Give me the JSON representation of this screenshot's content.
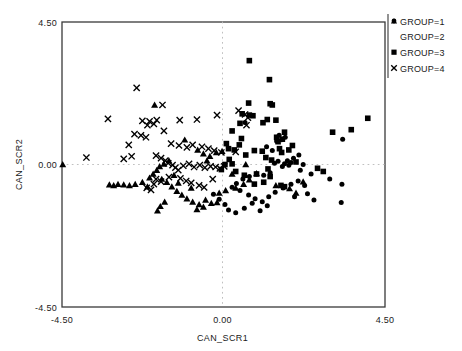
{
  "chart_data": {
    "type": "scatter",
    "title": "",
    "xlabel": "CAN_SCR1",
    "ylabel": "CAN_SCR2",
    "xlim": [
      -4.5,
      4.5
    ],
    "ylim": [
      -4.5,
      4.5
    ],
    "xticks": [
      -4.5,
      0.0,
      4.5
    ],
    "xtick_labels": [
      "-4.50",
      "0.00",
      "4.50"
    ],
    "yticks": [
      -4.5,
      0.0,
      4.5
    ],
    "ytick_labels": [
      "-4.50",
      "0.00",
      "4.50"
    ],
    "grid": false,
    "reference_lines": {
      "x": 0.0,
      "y": 0.0,
      "style": "dotted"
    },
    "legend_position": "top-right-outside",
    "legend": [
      {
        "label": "GROUP=1",
        "marker": "circle"
      },
      {
        "label": "GROUP=2",
        "marker": "triangle"
      },
      {
        "label": "GROUP=3",
        "marker": "square"
      },
      {
        "label": "GROUP=4",
        "marker": "x"
      }
    ],
    "series": [
      {
        "name": "GROUP=1",
        "marker": "circle",
        "points": [
          [
            0.6,
            1.33
          ],
          [
            1.55,
            0.92
          ],
          [
            1.72,
            0.86
          ],
          [
            1.62,
            0.78
          ],
          [
            1.48,
            0.74
          ],
          [
            3.32,
            0.8
          ],
          [
            2.1,
            0.3
          ],
          [
            1.95,
            0.2
          ],
          [
            1.78,
            0.12
          ],
          [
            1.88,
            0.06
          ],
          [
            1.7,
            0.02
          ],
          [
            1.82,
            -0.02
          ],
          [
            1.64,
            -0.06
          ],
          [
            1.52,
            0.1
          ],
          [
            1.42,
            0.04
          ],
          [
            2.22,
            0.0
          ],
          [
            1.3,
            -0.26
          ],
          [
            1.12,
            -0.34
          ],
          [
            0.92,
            -0.3
          ],
          [
            0.72,
            -0.38
          ],
          [
            0.54,
            -0.46
          ],
          [
            0.36,
            -0.6
          ],
          [
            0.24,
            -0.72
          ],
          [
            0.46,
            -0.82
          ],
          [
            0.7,
            -0.96
          ],
          [
            0.88,
            -1.08
          ],
          [
            1.08,
            -1.18
          ],
          [
            1.26,
            -1.02
          ],
          [
            1.44,
            -0.88
          ],
          [
            1.66,
            -0.74
          ],
          [
            1.88,
            -0.62
          ],
          [
            2.08,
            -0.52
          ],
          [
            2.26,
            -0.66
          ],
          [
            2.34,
            -0.92
          ],
          [
            2.52,
            -1.12
          ],
          [
            2.96,
            -0.46
          ],
          [
            3.3,
            -0.62
          ],
          [
            3.28,
            -1.2
          ],
          [
            0.14,
            -1.44
          ],
          [
            0.34,
            -1.52
          ],
          [
            0.58,
            -1.38
          ],
          [
            0.04,
            -1.26
          ],
          [
            -0.12,
            -1.1
          ],
          [
            -0.28,
            -0.94
          ],
          [
            1.02,
            -1.46
          ],
          [
            1.22,
            -1.3
          ],
          [
            0.8,
            -1.22
          ],
          [
            2.44,
            -0.3
          ],
          [
            1.98,
            -1.02
          ],
          [
            2.14,
            -0.18
          ],
          [
            1.36,
            0.44
          ],
          [
            1.2,
            0.56
          ]
        ]
      },
      {
        "name": "GROUP=2",
        "marker": "triangle",
        "points": [
          [
            -4.48,
            0.0
          ],
          [
            -1.92,
            1.88
          ],
          [
            -1.08,
            0.78
          ],
          [
            -0.72,
            0.46
          ],
          [
            -0.56,
            0.34
          ],
          [
            -0.38,
            0.26
          ],
          [
            -0.2,
            0.38
          ],
          [
            -0.04,
            0.42
          ],
          [
            -1.52,
            0.12
          ],
          [
            -1.66,
            0.02
          ],
          [
            -1.78,
            -0.06
          ],
          [
            -1.86,
            -0.18
          ],
          [
            -1.96,
            -0.3
          ],
          [
            -2.06,
            -0.42
          ],
          [
            -2.26,
            -0.56
          ],
          [
            -2.46,
            -0.62
          ],
          [
            -2.62,
            -0.66
          ],
          [
            -2.78,
            -0.64
          ],
          [
            -2.94,
            -0.62
          ],
          [
            -3.06,
            -0.66
          ],
          [
            -3.18,
            -0.64
          ],
          [
            -1.72,
            -0.46
          ],
          [
            -1.58,
            -0.56
          ],
          [
            -1.44,
            -0.7
          ],
          [
            -1.3,
            -0.84
          ],
          [
            -1.16,
            -0.96
          ],
          [
            -1.02,
            -1.08
          ],
          [
            -0.86,
            -1.18
          ],
          [
            -0.68,
            -1.26
          ],
          [
            -0.5,
            -1.12
          ],
          [
            -0.34,
            -1.22
          ],
          [
            -0.18,
            -1.2
          ],
          [
            -0.56,
            -1.34
          ],
          [
            -0.74,
            -1.42
          ],
          [
            -1.64,
            -1.18
          ],
          [
            -1.76,
            -1.32
          ],
          [
            -1.84,
            -1.46
          ],
          [
            -0.12,
            -0.9
          ],
          [
            0.06,
            -0.82
          ],
          [
            0.34,
            -0.74
          ],
          [
            0.56,
            -0.62
          ],
          [
            0.72,
            -0.48
          ],
          [
            0.24,
            -0.3
          ],
          [
            1.46,
            -0.66
          ],
          [
            1.84,
            -0.76
          ],
          [
            2.02,
            -0.9
          ],
          [
            0.92,
            -0.28
          ],
          [
            0.62,
            0.0
          ],
          [
            2.22,
            -0.54
          ],
          [
            -0.9,
            -0.74
          ],
          [
            -1.26,
            -0.58
          ],
          [
            -2.12,
            -0.7
          ],
          [
            -0.46,
            0.12
          ],
          [
            -1.38,
            -0.34
          ]
        ]
      },
      {
        "name": "GROUP=3",
        "marker": "square",
        "points": [
          [
            0.72,
            3.28
          ],
          [
            1.28,
            2.68
          ],
          [
            0.7,
            1.94
          ],
          [
            1.3,
            1.92
          ],
          [
            1.36,
            1.88
          ],
          [
            0.52,
            1.6
          ],
          [
            0.72,
            1.56
          ],
          [
            0.82,
            1.54
          ],
          [
            1.22,
            1.42
          ],
          [
            1.46,
            1.4
          ],
          [
            0.46,
            1.3
          ],
          [
            1.1,
            1.32
          ],
          [
            4.02,
            1.46
          ],
          [
            3.04,
            1.02
          ],
          [
            3.56,
            1.1
          ],
          [
            1.7,
            1.02
          ],
          [
            0.24,
            1.06
          ],
          [
            0.5,
            0.82
          ],
          [
            1.48,
            0.86
          ],
          [
            1.64,
            0.8
          ],
          [
            1.52,
            0.72
          ],
          [
            0.14,
            0.5
          ],
          [
            0.3,
            0.46
          ],
          [
            0.86,
            0.44
          ],
          [
            1.08,
            0.42
          ],
          [
            1.56,
            0.5
          ],
          [
            1.62,
            0.38
          ],
          [
            0.62,
            0.3
          ],
          [
            0.16,
            0.16
          ],
          [
            1.18,
            0.22
          ],
          [
            1.34,
            0.14
          ],
          [
            0.24,
            0.02
          ],
          [
            0.04,
            0.0
          ],
          [
            2.62,
            -0.12
          ],
          [
            2.78,
            -0.22
          ],
          [
            0.58,
            -0.34
          ],
          [
            0.92,
            -0.3
          ],
          [
            1.3,
            -0.38
          ],
          [
            1.12,
            -0.56
          ],
          [
            0.86,
            -0.62
          ],
          [
            1.6,
            -0.66
          ],
          [
            1.7,
            -0.7
          ],
          [
            0.34,
            -0.22
          ],
          [
            -0.06,
            -0.16
          ],
          [
            0.44,
            0.62
          ],
          [
            1.92,
            0.6
          ],
          [
            1.82,
            0.46
          ],
          [
            2.02,
            0.08
          ],
          [
            1.24,
            -0.14
          ],
          [
            0.08,
            0.66
          ]
        ]
      },
      {
        "name": "GROUP=4",
        "marker": "x",
        "points": [
          [
            -2.42,
            2.42
          ],
          [
            -1.7,
            1.88
          ],
          [
            -3.22,
            1.44
          ],
          [
            -2.26,
            1.38
          ],
          [
            -2.06,
            1.36
          ],
          [
            -1.86,
            1.4
          ],
          [
            -1.94,
            1.28
          ],
          [
            -2.12,
            1.24
          ],
          [
            -1.22,
            1.4
          ],
          [
            -0.74,
            1.42
          ],
          [
            -0.18,
            1.56
          ],
          [
            0.42,
            1.7
          ],
          [
            0.6,
            1.58
          ],
          [
            0.68,
            1.48
          ],
          [
            -1.66,
            1.06
          ],
          [
            -2.48,
            0.96
          ],
          [
            -2.3,
            0.92
          ],
          [
            -2.16,
            0.86
          ],
          [
            -1.46,
            0.66
          ],
          [
            -1.24,
            0.6
          ],
          [
            -1.02,
            0.54
          ],
          [
            -0.86,
            0.62
          ],
          [
            -0.6,
            0.56
          ],
          [
            -0.42,
            0.5
          ],
          [
            -0.26,
            0.44
          ],
          [
            -0.06,
            0.38
          ],
          [
            0.34,
            0.4
          ],
          [
            -3.82,
            0.22
          ],
          [
            -2.78,
            0.18
          ],
          [
            -2.56,
            0.26
          ],
          [
            -1.88,
            0.28
          ],
          [
            -1.74,
            0.2
          ],
          [
            -1.62,
            0.12
          ],
          [
            -1.54,
            0.04
          ],
          [
            -1.42,
            -0.02
          ],
          [
            -1.34,
            -0.1
          ],
          [
            -1.26,
            -0.18
          ],
          [
            -1.12,
            -0.04
          ],
          [
            -0.96,
            0.02
          ],
          [
            -0.82,
            -0.08
          ],
          [
            -0.66,
            -0.02
          ],
          [
            -0.52,
            -0.1
          ],
          [
            -0.36,
            -0.06
          ],
          [
            -0.22,
            -0.08
          ],
          [
            -0.1,
            -0.12
          ],
          [
            0.02,
            -0.06
          ],
          [
            -1.88,
            -0.46
          ],
          [
            -1.74,
            -0.54
          ],
          [
            -1.52,
            -0.4
          ],
          [
            -1.2,
            -0.44
          ],
          [
            -1.04,
            -0.52
          ],
          [
            -0.9,
            -0.58
          ],
          [
            -2.14,
            -0.74
          ],
          [
            -2.02,
            -0.8
          ],
          [
            -0.68,
            -0.66
          ],
          [
            -0.54,
            -0.72
          ],
          [
            -0.3,
            -0.46
          ],
          [
            -1.94,
            -0.62
          ],
          [
            0.64,
            1.24
          ],
          [
            -2.64,
            0.62
          ]
        ]
      }
    ]
  },
  "axis": {
    "x_title": "CAN_SCR1",
    "y_title": "CAN_SCR2",
    "x_min_label": "-4.50",
    "x_mid_label": "0.00",
    "x_max_label": "4.50",
    "y_min_label": "-4.50",
    "y_mid_label": "0.00",
    "y_max_label": "4.50"
  },
  "legend": {
    "item_1": "GROUP=1",
    "item_2": "GROUP=2",
    "item_3": "GROUP=3",
    "item_4": "GROUP=4"
  },
  "colors": {
    "marker": "#000000",
    "frame": "#3a3a3a",
    "refline": "#b9b9b9",
    "background": "#ffffff"
  }
}
